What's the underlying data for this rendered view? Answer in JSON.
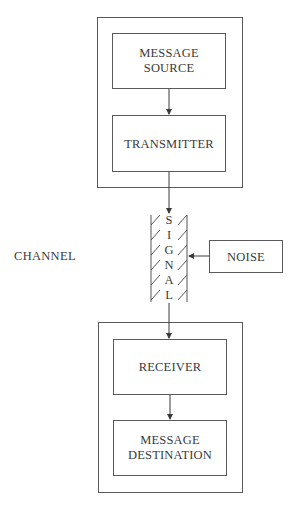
{
  "diagram": {
    "type": "communication-model",
    "nodes": {
      "message_source": "MESSAGE\nSOURCE",
      "message_source_line1": "MESSAGE",
      "message_source_line2": "SOURCE",
      "transmitter": "TRANSMITTER",
      "signal_letters": [
        "S",
        "I",
        "G",
        "N",
        "A",
        "L"
      ],
      "noise": "NOISE",
      "receiver": "RECEIVER",
      "message_destination_line1": "MESSAGE",
      "message_destination_line2": "DESTINATION"
    },
    "side_label": "CHANNEL",
    "edges": [
      {
        "from": "MESSAGE SOURCE",
        "to": "TRANSMITTER"
      },
      {
        "from": "TRANSMITTER",
        "to": "SIGNAL"
      },
      {
        "from": "NOISE",
        "to": "SIGNAL"
      },
      {
        "from": "SIGNAL",
        "to": "RECEIVER"
      },
      {
        "from": "RECEIVER",
        "to": "MESSAGE DESTINATION"
      }
    ],
    "colors": {
      "line": "#4a4a4a",
      "text": "#3a3a3a",
      "background": "#ffffff"
    }
  }
}
